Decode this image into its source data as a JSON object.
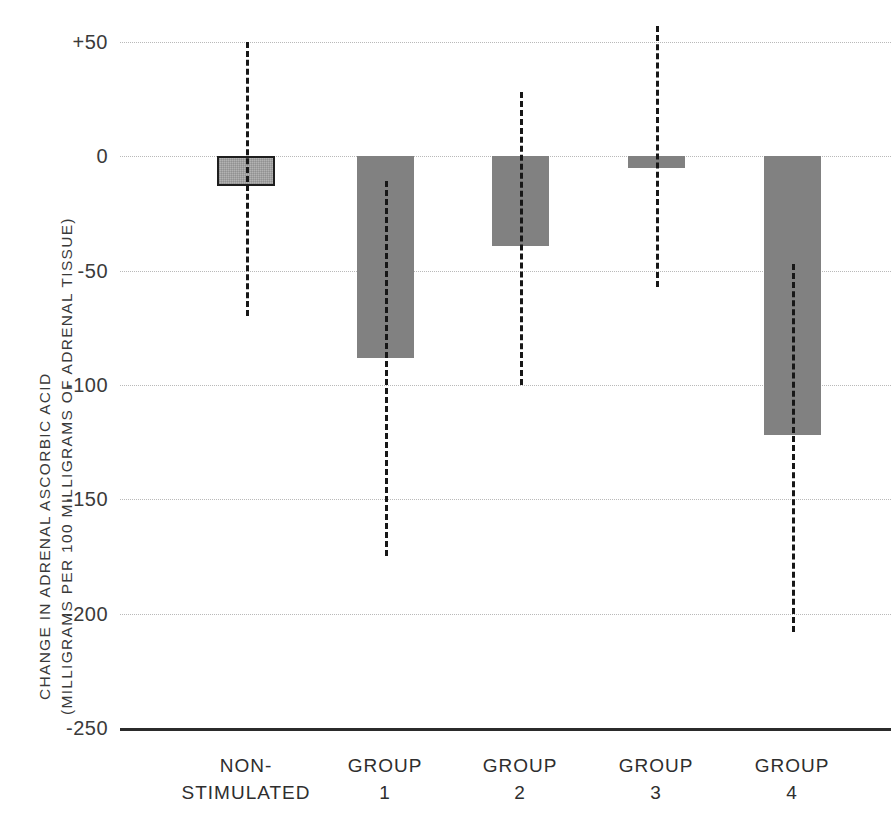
{
  "chart_data": {
    "type": "bar",
    "title": "",
    "subtitle": "",
    "xlabel": "",
    "ylabel_line1": "CHANGE IN ADRENAL ASCORBIC ACID",
    "ylabel_line2": "(MILLIGRAMS PER 100 MILLIGRAMS OF ADRENAL TISSUE)",
    "categories": [
      "NON-STIMULATED",
      "GROUP 1",
      "GROUP 2",
      "GROUP 3",
      "GROUP 4"
    ],
    "category_lines": [
      [
        "NON-",
        "STIMULATED"
      ],
      [
        "GROUP",
        "1"
      ],
      [
        "GROUP",
        "2"
      ],
      [
        "GROUP",
        "3"
      ],
      [
        "GROUP",
        "4"
      ]
    ],
    "values": [
      -13,
      -88,
      -39,
      -5,
      -122
    ],
    "error_low": [
      -70,
      -175,
      -100,
      -57,
      -208
    ],
    "error_high": [
      50,
      -11,
      28,
      57,
      -47
    ],
    "ylim": [
      -250,
      50
    ],
    "yticks": [
      50,
      0,
      -50,
      -100,
      -150,
      -200,
      -250
    ],
    "ytick_labels": [
      "+50",
      "0",
      "-50",
      "-100",
      "-150",
      "-200",
      "-250"
    ],
    "grid": true,
    "legend": "none",
    "bar_colors": [
      "#b3b3b3",
      "#818181",
      "#818181",
      "#818181",
      "#818181"
    ],
    "bar_outline_color": "#1e1e1e",
    "error_bar_color": "#171717",
    "gridline_color": "#b9b9b9",
    "baseline_color": "#2b2b2b",
    "background_color": "#ffffff"
  },
  "axis": {
    "y_ticks": [
      {
        "label": "+50",
        "value": 50
      },
      {
        "label": "0",
        "value": 0
      },
      {
        "label": "-50",
        "value": -50
      },
      {
        "label": "-100",
        "value": -100
      },
      {
        "label": "-150",
        "value": -150
      },
      {
        "label": "-200",
        "value": -200
      },
      {
        "label": "-250",
        "value": -250
      }
    ]
  }
}
